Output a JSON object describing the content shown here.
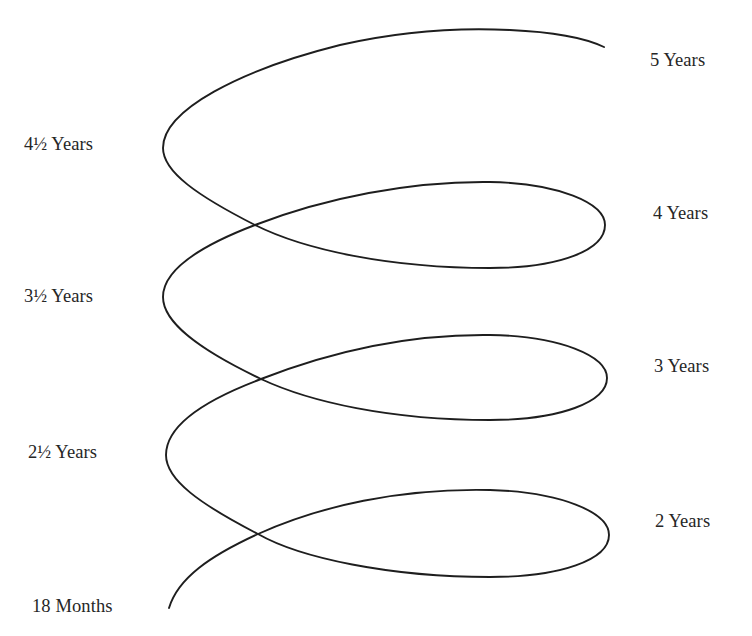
{
  "diagram": {
    "type": "developmental-spiral",
    "stroke_color": "#1e1e1e",
    "background_color": "#ffffff",
    "labels_left": [
      {
        "id": "age-4-5",
        "text": "4½ Years",
        "x": 24,
        "y": 135
      },
      {
        "id": "age-3-5",
        "text": "3½ Years",
        "x": 24,
        "y": 287
      },
      {
        "id": "age-2-5",
        "text": "2½ Years",
        "x": 28,
        "y": 443
      },
      {
        "id": "age-18-months",
        "text": "18 Months",
        "x": 32,
        "y": 597
      }
    ],
    "labels_right": [
      {
        "id": "age-5",
        "text": "5 Years",
        "x": 650,
        "y": 51
      },
      {
        "id": "age-4",
        "text": "4 Years",
        "x": 653,
        "y": 204
      },
      {
        "id": "age-3",
        "text": "3 Years",
        "x": 654,
        "y": 357
      },
      {
        "id": "age-2",
        "text": "2 Years",
        "x": 655,
        "y": 512
      }
    ],
    "spiral_key_points": {
      "start": [
        169,
        608
      ],
      "crossings": [
        [
          258,
          534
        ],
        [
          261,
          379
        ],
        [
          255,
          225
        ]
      ],
      "right_extremes": [
        [
          609,
          535
        ],
        [
          607,
          378
        ],
        [
          605,
          225
        ]
      ],
      "left_extremes": [
        [
          166,
          455
        ],
        [
          163,
          297
        ],
        [
          163,
          148
        ]
      ],
      "end": [
        604,
        47
      ]
    }
  }
}
